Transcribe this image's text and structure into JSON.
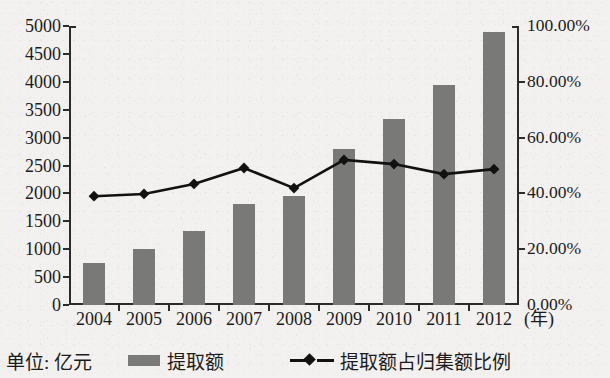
{
  "chart_data": {
    "type": "bar",
    "title": "",
    "xlabel": "(年)",
    "ylabel": "",
    "unit_note": "单位: 亿元",
    "categories": [
      "2004",
      "2005",
      "2006",
      "2007",
      "2008",
      "2009",
      "2010",
      "2011",
      "2012"
    ],
    "ylim": [
      0,
      5000
    ],
    "y_ticks": [
      "0",
      "500",
      "1000",
      "1500",
      "2000",
      "2500",
      "3000",
      "3500",
      "4000",
      "4500",
      "5000"
    ],
    "y_tick_values": [
      0,
      500,
      1000,
      1500,
      2000,
      2500,
      3000,
      3500,
      4000,
      4500,
      5000
    ],
    "y2lim": [
      0,
      100
    ],
    "y2_ticks": [
      "0.00%",
      "20.00%",
      "40.00%",
      "60.00%",
      "80.00%",
      "100.00%"
    ],
    "y2_tick_values": [
      0,
      20,
      40,
      60,
      80,
      100
    ],
    "grid": false,
    "legend_position": "bottom",
    "series": [
      {
        "name": "提取额",
        "type": "bar",
        "axis": "left",
        "color": "#797977",
        "values": [
          750,
          1000,
          1320,
          1810,
          1960,
          2790,
          3340,
          3950,
          4890
        ]
      },
      {
        "name": "提取额占归集额比例",
        "type": "line",
        "axis": "right",
        "color": "#111111",
        "marker": "diamond",
        "values": [
          39.0,
          39.8,
          43.4,
          49.1,
          41.9,
          52.0,
          50.5,
          46.9,
          48.7
        ]
      }
    ]
  },
  "axes": {
    "x_axis_unit": "(年)"
  },
  "legend": {
    "unit_label": "单位: 亿元",
    "bar_label": "提取额",
    "line_label": "提取额占归集额比例"
  }
}
